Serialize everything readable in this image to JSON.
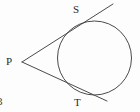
{
  "figure": {
    "type": "geometry-diagram",
    "background_color": "#fdfdfd",
    "stroke_color": "#4a4a4a",
    "label_color": "#2b2b2b",
    "stroke_width": 1,
    "canvas": {
      "width": 140,
      "height": 112
    }
  },
  "labels": {
    "external_point": "P",
    "upper_tangent_point": "S",
    "lower_tangent_point": "T",
    "corner_mark": "3"
  },
  "geometry": {
    "circle": {
      "cx": 94.5,
      "cy": 58,
      "r": 37
    },
    "point_P": {
      "x": 22,
      "y": 62
    },
    "point_S": {
      "x": 79.5,
      "y": 22.5
    },
    "point_T": {
      "x": 77.5,
      "y": 92.5
    },
    "upper_tangent_line": {
      "x1": 22,
      "y1": 62,
      "x2": 113,
      "y2": 4
    },
    "lower_tangent_line": {
      "x1": 22,
      "y1": 62,
      "x2": 107,
      "y2": 101
    }
  }
}
